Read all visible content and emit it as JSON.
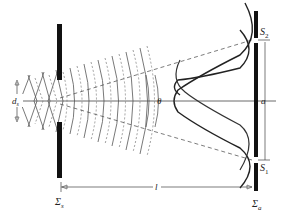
{
  "diagram": {
    "labels": {
      "source_width": "d",
      "source_width_sub": "s",
      "source_screen": "Σ",
      "source_screen_sub": "s",
      "aperture_screen": "Σ",
      "aperture_screen_sub": "a",
      "slit_top": "S",
      "slit_top_sub": "2",
      "slit_bottom": "S",
      "slit_bottom_sub": "1",
      "slit_separation": "a",
      "distance": "l",
      "angle": "θ"
    },
    "colors": {
      "line": "#222222",
      "wave": "#555555",
      "background": "#ffffff"
    }
  }
}
